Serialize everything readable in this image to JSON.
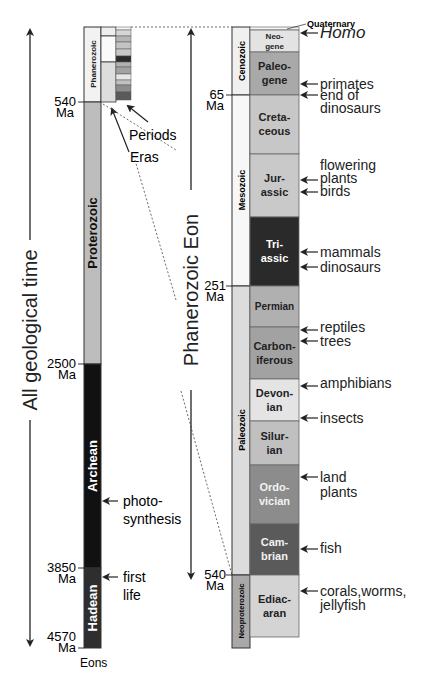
{
  "left_axis_title": "All geological time",
  "right_axis_title": "Phanerozoic Eon",
  "eons_label": "Eons",
  "pointer_labels": {
    "periods": "Periods",
    "eras": "Eras"
  },
  "eons": [
    {
      "name": "Phanerozoic",
      "start_ma": 0,
      "end_ma": 540,
      "color": "#f2f2f2",
      "text_color": "#222222"
    },
    {
      "name": "Proterozoic",
      "start_ma": 540,
      "end_ma": 2500,
      "color": "#bdbdbd",
      "text_color": "#111111"
    },
    {
      "name": "Archean",
      "start_ma": 2500,
      "end_ma": 3850,
      "color": "#111111",
      "text_color": "#ffffff"
    },
    {
      "name": "Hadean",
      "start_ma": 3850,
      "end_ma": 4570,
      "color": "#2e2e2e",
      "text_color": "#ffffff"
    }
  ],
  "left_ticks": [
    {
      "value": "540",
      "unit": "Ma"
    },
    {
      "value": "2500",
      "unit": "Ma"
    },
    {
      "value": "3850",
      "unit": "Ma"
    },
    {
      "value": "4570",
      "unit": "Ma"
    }
  ],
  "left_events": [
    {
      "text": [
        "photo-",
        "synthesis"
      ],
      "at": "Archean"
    },
    {
      "text": [
        "first",
        "life"
      ],
      "at": "Hadean"
    }
  ],
  "eras": [
    {
      "name": "Cenozoic",
      "color": "#f0f0f0"
    },
    {
      "name": "Mesozoic",
      "color": "#f7f7f7"
    },
    {
      "name": "Paleozoic",
      "color": "#dcdcdc"
    },
    {
      "name": "Neoproterozoic",
      "color": "#a8a8a8"
    }
  ],
  "periods": [
    {
      "name": [
        "Neo-",
        "gene"
      ],
      "color": "#e3e3e3",
      "text_color": "#222222"
    },
    {
      "name": [
        "Paleo-",
        "gene"
      ],
      "color": "#a9a9a9",
      "text_color": "#222222"
    },
    {
      "name": [
        "Creta-",
        "ceous"
      ],
      "color": "#c7c7c7",
      "text_color": "#222222"
    },
    {
      "name": [
        "Jur-",
        "assic"
      ],
      "color": "#c9c9c9",
      "text_color": "#222222"
    },
    {
      "name": [
        "Tri-",
        "assic"
      ],
      "color": "#2a2a2a",
      "text_color": "#ffffff"
    },
    {
      "name": [
        "Permian"
      ],
      "color": "#b0b0b0",
      "text_color": "#222222"
    },
    {
      "name": [
        "Carbon-",
        "iferous"
      ],
      "color": "#a2a2a2",
      "text_color": "#222222"
    },
    {
      "name": [
        "Devon-",
        "ian"
      ],
      "color": "#e4e4e4",
      "text_color": "#222222"
    },
    {
      "name": [
        "Silur-",
        "ian"
      ],
      "color": "#c0c0c0",
      "text_color": "#222222"
    },
    {
      "name": [
        "Ordo-",
        "vician"
      ],
      "color": "#8c8c8c",
      "text_color": "#f2f2f2"
    },
    {
      "name": [
        "Cam-",
        "brian"
      ],
      "color": "#5a5a5a",
      "text_color": "#f2f2f2"
    },
    {
      "name": [
        "Ediac-",
        "aran"
      ],
      "color": "#d4d4d4",
      "text_color": "#222222"
    }
  ],
  "quaternary_label": "Quaternary",
  "right_ticks": [
    {
      "value": "65",
      "unit": "Ma"
    },
    {
      "value": "251",
      "unit": "Ma"
    },
    {
      "value": "540",
      "unit": "Ma"
    }
  ],
  "right_events": [
    {
      "text": [
        "Homo"
      ],
      "italic": true
    },
    {
      "text": [
        "primates"
      ]
    },
    {
      "text": [
        "end of",
        "dinosaurs"
      ]
    },
    {
      "text": [
        "flowering",
        "plants"
      ]
    },
    {
      "text": [
        "birds"
      ]
    },
    {
      "text": [
        "mammals"
      ]
    },
    {
      "text": [
        "dinosaurs"
      ]
    },
    {
      "text": [
        "reptiles"
      ]
    },
    {
      "text": [
        "trees"
      ]
    },
    {
      "text": [
        "amphibians"
      ]
    },
    {
      "text": [
        "insects"
      ]
    },
    {
      "text": [
        "land",
        "plants"
      ]
    },
    {
      "text": [
        "fish"
      ]
    },
    {
      "text": [
        "corals,worms,",
        "jellyfish"
      ]
    }
  ]
}
